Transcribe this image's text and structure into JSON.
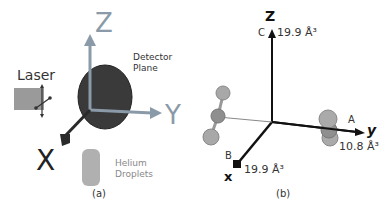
{
  "panel_a": {
    "caption": "(a)",
    "axis_z": "Z",
    "axis_y": "Y",
    "axis_x": "X",
    "laser_label": "Laser",
    "detector_label_1": "Detector",
    "detector_label_2": "Plane",
    "helium_label_1": "Helium",
    "helium_label_2": "Droplets",
    "colors": {
      "axis_z": "#8a9aa8",
      "axis_y": "#8a9aa8",
      "axis_x": "#2a2a2a",
      "detector": "#333333",
      "laser": "#9a9a9a",
      "helium": "#b0b0b0"
    }
  },
  "panel_b": {
    "caption": "(b)",
    "axis_z": "Z",
    "axis_y": "y",
    "axis_x": "x",
    "label_c": "C",
    "label_a": "A",
    "label_b": "B",
    "value_c": "19.9 Å³",
    "value_a": "10.8 Å³",
    "value_b": "19.9 Å³"
  }
}
